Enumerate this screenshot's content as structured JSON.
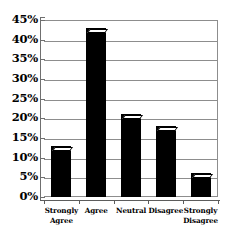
{
  "chart_data": {
    "type": "bar",
    "title": "",
    "subtitle": "",
    "xlabel": "",
    "ylabel": "",
    "categories": [
      "Strongly Agree",
      "Agree",
      "Neutral",
      "Disagree",
      "Strongly Disagree"
    ],
    "category_lines": [
      [
        "Strongly",
        "Agree"
      ],
      [
        "Agree"
      ],
      [
        "Neutral"
      ],
      [
        "Disagree"
      ],
      [
        "Strongly",
        "Disagree"
      ]
    ],
    "values": [
      13,
      43,
      21,
      18,
      6
    ],
    "value_labels": [
      "13%",
      "43%",
      "21%",
      "18%",
      "6%"
    ],
    "ylim": [
      0,
      45
    ],
    "ytick_values": [
      45,
      40,
      35,
      30,
      25,
      20,
      15,
      10,
      5,
      0
    ],
    "ytick_labels": [
      "45%",
      "40%",
      "35%",
      "30%",
      "25%",
      "20%",
      "15%",
      "10%",
      "5%",
      "0%"
    ],
    "grid": true,
    "grid_orientation": "horizontal",
    "legend": false,
    "legend_position": "none",
    "bar_color": "#000000",
    "bar_top_color": "#ffffff",
    "grid_color": "#8d8d8d",
    "axis_color": "#5c5c5c",
    "background_color": "#ffffff"
  }
}
